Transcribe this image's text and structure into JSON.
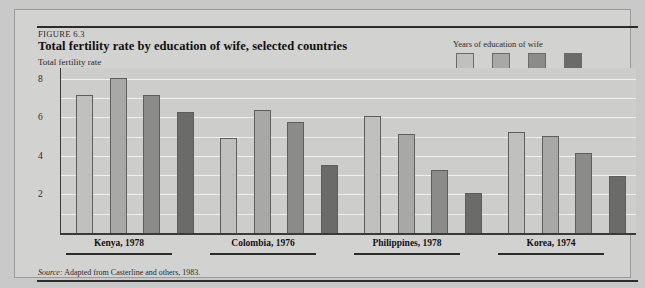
{
  "figure": {
    "kicker": "FIGURE 6.3",
    "title": "Total fertility rate by education of wife, selected countries",
    "axis_title": "Total fertility rate",
    "source": "Adapted from Casterline and others, 1983.",
    "source_prefix": "Source:"
  },
  "legend": {
    "title": "Years of education of wife",
    "items": [
      {
        "label": "0",
        "color": "#c0c0be"
      },
      {
        "label": "1-3",
        "color": "#a8a8a6"
      },
      {
        "label": "4-6",
        "color": "#8b8b89"
      },
      {
        "label": "7+",
        "color": "#6b6b69"
      }
    ]
  },
  "chart_data": {
    "type": "bar",
    "title": "Total fertility rate by education of wife, selected countries",
    "xlabel": "",
    "ylabel": "Total fertility rate",
    "ylim": [
      0,
      8.6
    ],
    "yticks": [
      2,
      4,
      6,
      8
    ],
    "gridlines": [
      1,
      2,
      3,
      4,
      5,
      6,
      7,
      8
    ],
    "grid": true,
    "legend_position": "top-right",
    "categories": [
      "Kenya, 1978",
      "Colombia, 1976",
      "Philippines, 1978",
      "Korea, 1974"
    ],
    "series": [
      {
        "name": "0",
        "color": "#c0c0be",
        "values": [
          7.2,
          5.0,
          6.1,
          5.3
        ]
      },
      {
        "name": "1-3",
        "color": "#a8a8a6",
        "values": [
          8.1,
          6.4,
          5.2,
          5.1
        ]
      },
      {
        "name": "4-6",
        "color": "#8b8b89",
        "values": [
          7.2,
          5.8,
          3.3,
          4.2
        ]
      },
      {
        "name": "7+",
        "color": "#6b6b69",
        "values": [
          6.3,
          3.6,
          2.1,
          3.0
        ]
      }
    ]
  }
}
